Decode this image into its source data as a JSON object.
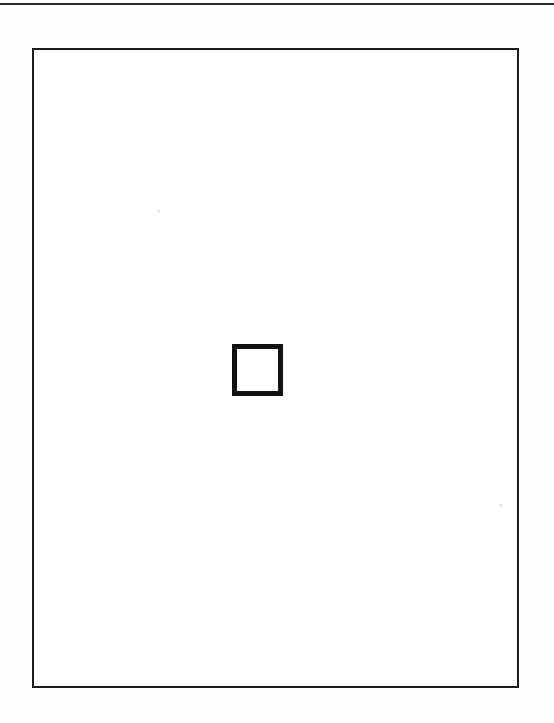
{
  "page": {
    "name": "scanned-figure-page",
    "width": 554,
    "height": 723,
    "background_color": "#fefefe",
    "caption": ""
  },
  "scan_edge_rule": {
    "name": "scan-edge-rule",
    "label": "",
    "color": "#2a2a2a",
    "x": 0,
    "y": 3,
    "width": 554,
    "height": 2
  },
  "figure_frame": {
    "name": "figure-frame",
    "label": "",
    "border_color": "#1b1b1b",
    "border_width": 2,
    "fill_color": "#ffffff",
    "x": 32,
    "y": 48,
    "width": 487,
    "height": 640
  },
  "inner_square": {
    "name": "inner-square",
    "label": "",
    "border_color": "#111111",
    "border_width": 5,
    "fill_color": "#ffffff",
    "x": 232,
    "y": 344,
    "width": 51,
    "height": 52
  },
  "specks": [
    {
      "name": "speck-upper-left",
      "color": "#e9e9e9",
      "x": 157,
      "y": 210,
      "size": 3
    },
    {
      "name": "speck-lower-right",
      "color": "#e9e9e9",
      "x": 499,
      "y": 504,
      "size": 3
    }
  ]
}
